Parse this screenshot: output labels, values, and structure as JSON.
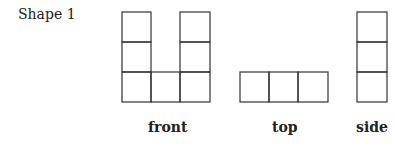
{
  "title": "Shape 1",
  "views": {
    "front": {
      "label": "front"
    },
    "top": {
      "label": "top"
    },
    "side": {
      "label": "side"
    }
  }
}
